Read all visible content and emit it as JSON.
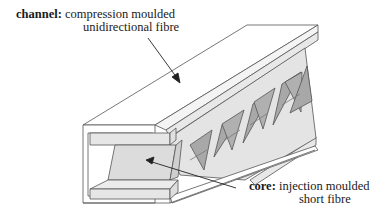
{
  "diagram": {
    "labels": {
      "channel": {
        "term": "channel:",
        "line1": "compression moulded",
        "line2": "unidirectional fibre"
      },
      "core": {
        "term": "core:",
        "line1": "injection moulded",
        "line2": "short fibre"
      }
    },
    "colors": {
      "outline": "#555555",
      "channel_fill": "#ffffff",
      "flange_fill": "#e6e6e6",
      "core_light": "#d9d9d9",
      "core_dark": "#a8a8a8",
      "arrow": "#222222"
    }
  }
}
